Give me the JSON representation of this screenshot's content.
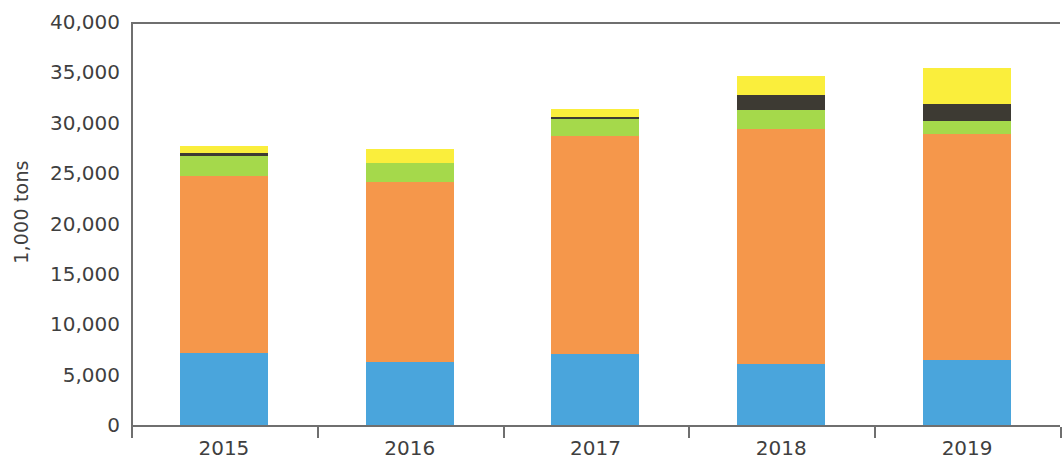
{
  "chart_data": {
    "type": "bar",
    "stacked": true,
    "title": "",
    "subtitle": "",
    "xlabel": "",
    "ylabel": "1,000 tons",
    "categories": [
      "2015",
      "2016",
      "2017",
      "2018",
      "2019"
    ],
    "ylim": [
      0,
      40000
    ],
    "ytick_values": [
      0,
      5000,
      10000,
      15000,
      20000,
      25000,
      30000,
      35000,
      40000
    ],
    "ytick_labels": [
      "0",
      "5,000",
      "10,000",
      "15,000",
      "20,000",
      "25,000",
      "30,000",
      "35,000",
      "40,000"
    ],
    "grid": false,
    "legend_position": "none",
    "series": [
      {
        "name": "series-1-blue",
        "color": "#4AA5DC",
        "values": [
          7100,
          6300,
          7000,
          6100,
          6500
        ]
      },
      {
        "name": "series-2-orange",
        "color": "#F5974B",
        "values": [
          17600,
          17800,
          21700,
          23300,
          22400
        ]
      },
      {
        "name": "series-3-green",
        "color": "#A5D94B",
        "values": [
          2000,
          1900,
          1700,
          1900,
          1300
        ]
      },
      {
        "name": "series-4-dark",
        "color": "#3D3A33",
        "values": [
          300,
          0,
          200,
          1500,
          1700
        ]
      },
      {
        "name": "series-5-yellow",
        "color": "#FAEE3C",
        "values": [
          700,
          1400,
          800,
          1800,
          3500
        ]
      }
    ],
    "totals": [
      26700,
      27400,
      31400,
      34600,
      35400
    ],
    "axis_color": "#6F6F6F",
    "background_color": "#FFFFFF"
  }
}
